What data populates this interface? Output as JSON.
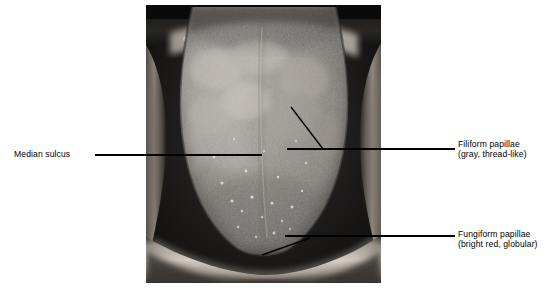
{
  "figure": {
    "type": "anatomical-photograph",
    "image_colors": {
      "background": "#ffffff",
      "photo_dark": "#1d1d1d",
      "photo_mid": "#8a8a8a",
      "photo_light": "#e6e6e6",
      "leader_line": "#000000",
      "text": "#000000"
    }
  },
  "labels": {
    "median_sulcus": {
      "name": "Median sulcus",
      "detail": ""
    },
    "filiform": {
      "name": "Filiform papillae",
      "detail": "(gray, thread-like)"
    },
    "fungiform": {
      "name": "Fungiform papillae",
      "detail": "(bright red, globular)"
    }
  },
  "leader_lines": [
    {
      "for": "median_sulcus",
      "points": "95,155 262,155"
    },
    {
      "for": "filiform",
      "points": "291,107 323,149"
    },
    {
      "for": "filiform",
      "points": "287,149 455,149"
    },
    {
      "for": "fungiform",
      "points": "262,255 310,238"
    },
    {
      "for": "fungiform",
      "points": "285,236 455,236"
    }
  ]
}
